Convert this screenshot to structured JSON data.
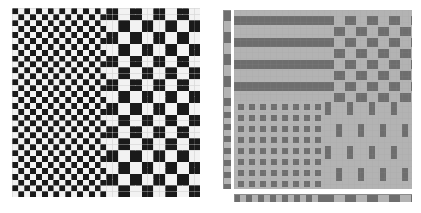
{
  "page": {
    "background": "#ffffff",
    "width": 421,
    "height": 213
  },
  "palette": {
    "white": "#ffffff",
    "black": "#1a1a1a",
    "light_gray": "#b3b3b3",
    "mid_gray": "#7f7f7f",
    "dark_gray": "#6e6e6e",
    "grid_line": "#d8d8d8"
  },
  "figures": [
    {
      "id": "checkerboard-figure",
      "name": "Checkerboard scale-change figure",
      "caption": "",
      "type": "binary-checkerboard",
      "rect": {
        "x": 12,
        "y": 8,
        "w": 188,
        "h": 189
      },
      "grid": {
        "cols": 32,
        "rows": 32
      },
      "regions": [
        {
          "name": "fine-checker-region",
          "columns": "0-15",
          "cell_size_cells": 1,
          "description": "1x1 cell alternating black and white checkerboard"
        },
        {
          "name": "coarse-checker-region",
          "columns": "16-31",
          "cell_size_cells": 2,
          "description": "2x2 cell alternating black and white checkerboard"
        }
      ],
      "colors": {
        "on": "#1a1a1a",
        "off": "#f2f2f2",
        "line": "#d8d8d8"
      }
    },
    {
      "id": "texture-quadrant-figure",
      "name": "Four-quadrant gray texture figure",
      "caption": "",
      "type": "quadrant-texture",
      "rect": {
        "x": 234,
        "y": 10,
        "w": 178,
        "h": 179
      },
      "background": "#b3b3b3",
      "quadrants": [
        {
          "name": "top-left-quadrant",
          "position": "top-left",
          "pattern": "horizontal-stripes",
          "period_px": 22,
          "bar_px": 9,
          "description": "Straight horizontal dark-gray bars"
        },
        {
          "name": "top-right-quadrant",
          "position": "top-right",
          "pattern": "zigzag-staircase",
          "period_px": 22,
          "bar_px": 9,
          "step_px": 11,
          "description": "Staircase / zigzag dark-gray bars descending to the right"
        },
        {
          "name": "bottom-left-quadrant",
          "position": "bottom-left",
          "pattern": "square-dot-grid",
          "period_px": 11,
          "dot_px": 6,
          "description": "Regular grid of small dark-gray squares"
        },
        {
          "name": "bottom-right-quadrant",
          "position": "bottom-right",
          "pattern": "staggered-vertical-bars",
          "period_x_px": 22,
          "period_y_px": 22,
          "bar_w_px": 6,
          "bar_h_px": 13,
          "description": "Offset / staggered tall dark-gray rectangles"
        }
      ],
      "rulers": [
        {
          "name": "vertical-ruler",
          "orientation": "vertical",
          "rect": {
            "x": 223,
            "y": 10,
            "w": 8,
            "h": 179
          },
          "segments": [
            {
              "name": "coarse-segment",
              "span": "top-half",
              "cell_px": 11
            },
            {
              "name": "fine-segment",
              "span": "bottom-half",
              "cell_px": 6
            }
          ]
        },
        {
          "name": "horizontal-ruler",
          "orientation": "horizontal",
          "rect": {
            "x": 234,
            "y": 194,
            "w": 178,
            "h": 8
          },
          "segments": [
            {
              "name": "fine-segment",
              "span": "left-half",
              "cell_px": 6
            },
            {
              "name": "coarse-segment",
              "span": "right-half",
              "cell_px": 11
            }
          ]
        }
      ],
      "colors": {
        "on": "#6e6e6e",
        "off": "#b3b3b3",
        "line": "#a0a0a0"
      }
    }
  ]
}
